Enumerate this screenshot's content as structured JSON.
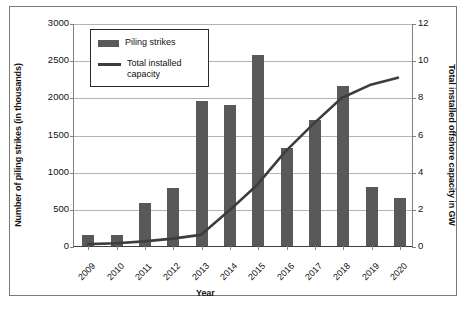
{
  "chart_data": {
    "type": "bar",
    "title": "",
    "xlabel": "Year",
    "ylabel": "Number of piling strikes (in thousands)",
    "y2label": "Total installed offshore capacity in GW",
    "categories": [
      "2009",
      "2010",
      "2011",
      "2012",
      "2013",
      "2014",
      "2015",
      "2016",
      "2017",
      "2018",
      "2019",
      "2020"
    ],
    "ylim": [
      0,
      3000
    ],
    "y2lim": [
      0,
      12
    ],
    "yticks": [
      0,
      500,
      1000,
      1500,
      2000,
      2500,
      3000
    ],
    "y2ticks": [
      0,
      2,
      4,
      6,
      8,
      10,
      12
    ],
    "grid": true,
    "legend_position": "upper-left-inside",
    "series": [
      {
        "name": "Piling strikes",
        "type": "bar",
        "axis": "left",
        "color": "#595959",
        "values": [
          155,
          145,
          585,
          785,
          1945,
          1895,
          2570,
          1325,
          1700,
          2150,
          790,
          640
        ]
      },
      {
        "name": "Total installed capacity",
        "type": "line",
        "axis": "right",
        "color": "#3d3d3d",
        "values": [
          0.1,
          0.15,
          0.25,
          0.4,
          0.6,
          1.9,
          3.3,
          5.1,
          6.6,
          8.0,
          8.7,
          9.1
        ]
      }
    ]
  },
  "legend": {
    "items": [
      {
        "label": "Piling strikes",
        "marker": "bar-swatch"
      },
      {
        "label": "Total installed capacity",
        "marker": "line-swatch"
      }
    ]
  },
  "axes": {
    "x_title": "Year",
    "y_left_title": "Number of piling strikes (in thousands)",
    "y_right_title": "Total installed offshore capacity in GW"
  }
}
